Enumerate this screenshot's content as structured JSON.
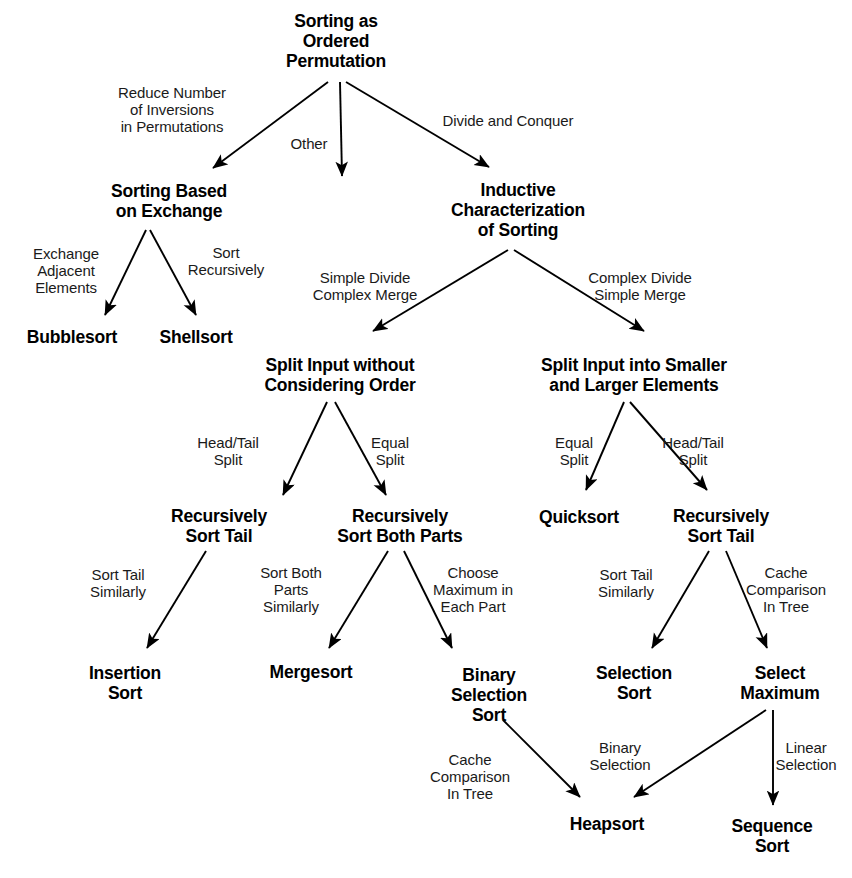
{
  "diagram": {
    "type": "tree-diagram",
    "background_color": "#ffffff",
    "text_color": "#000000",
    "arrow_color": "#000000",
    "nodes": [
      {
        "id": "root",
        "label": "Sorting as\nOrdered\nPermutation",
        "x": 336,
        "y": 42,
        "w": 200
      },
      {
        "id": "exchange",
        "label": "Sorting Based\non Exchange",
        "x": 169,
        "y": 202,
        "w": 200
      },
      {
        "id": "inductive",
        "label": "Inductive\nCharacterization\nof Sorting",
        "x": 518,
        "y": 211,
        "w": 220
      },
      {
        "id": "bubblesort",
        "label": "Bubblesort",
        "x": 72,
        "y": 338,
        "w": 140
      },
      {
        "id": "shellsort",
        "label": "Shellsort",
        "x": 196,
        "y": 338,
        "w": 130
      },
      {
        "id": "split_noorder",
        "label": "Split Input without\nConsidering Order",
        "x": 340,
        "y": 376,
        "w": 250
      },
      {
        "id": "split_smaller",
        "label": "Split Input into Smaller\nand Larger Elements",
        "x": 634,
        "y": 376,
        "w": 280
      },
      {
        "id": "rec_tail_left",
        "label": "Recursively\nSort Tail",
        "x": 219,
        "y": 527,
        "w": 160
      },
      {
        "id": "rec_both",
        "label": "Recursively\nSort Both Parts",
        "x": 400,
        "y": 527,
        "w": 190
      },
      {
        "id": "quicksort",
        "label": "Quicksort",
        "x": 579,
        "y": 518,
        "w": 130
      },
      {
        "id": "rec_tail_right",
        "label": "Recursively\nSort Tail",
        "x": 721,
        "y": 527,
        "w": 160
      },
      {
        "id": "insertion_sort",
        "label": "Insertion\nSort",
        "x": 125,
        "y": 684,
        "w": 140
      },
      {
        "id": "mergesort",
        "label": "Mergesort",
        "x": 311,
        "y": 673,
        "w": 150
      },
      {
        "id": "binary_sel_sort",
        "label": "Binary\nSelection\nSort",
        "x": 489,
        "y": 696,
        "w": 140
      },
      {
        "id": "selection_sort",
        "label": "Selection\nSort",
        "x": 634,
        "y": 684,
        "w": 140
      },
      {
        "id": "select_max",
        "label": "Select\nMaximum",
        "x": 780,
        "y": 684,
        "w": 150
      },
      {
        "id": "heapsort",
        "label": "Heapsort",
        "x": 607,
        "y": 825,
        "w": 140
      },
      {
        "id": "sequence_sort",
        "label": "Sequence\nSort",
        "x": 772,
        "y": 837,
        "w": 150
      }
    ],
    "edges": [
      {
        "from": "root",
        "to": "exchange",
        "label": "Reduce Number\nof Inversions\nin Permutations",
        "lx": 172,
        "ly": 110,
        "x1": 328,
        "y1": 82,
        "x2": 213,
        "y2": 168
      },
      {
        "from": "root",
        "to": "middle",
        "label": "Other",
        "lx": 309,
        "ly": 144,
        "x1": 340,
        "y1": 82,
        "x2": 342,
        "y2": 176
      },
      {
        "from": "root",
        "to": "inductive",
        "label": "Divide and Conquer",
        "lx": 508,
        "ly": 121,
        "x1": 346,
        "y1": 82,
        "x2": 489,
        "y2": 167
      },
      {
        "from": "exchange",
        "to": "bubblesort",
        "label": "Exchange\nAdjacent\nElements",
        "lx": 66,
        "ly": 271,
        "x1": 146,
        "y1": 230,
        "x2": 105,
        "y2": 315
      },
      {
        "from": "exchange",
        "to": "shellsort",
        "label": "Sort\nRecursively",
        "lx": 226,
        "ly": 261,
        "x1": 150,
        "y1": 230,
        "x2": 196,
        "y2": 315
      },
      {
        "from": "inductive",
        "to": "split_noorder",
        "label": "Simple Divide\nComplex Merge",
        "lx": 365,
        "ly": 286,
        "x1": 508,
        "y1": 250,
        "x2": 373,
        "y2": 331
      },
      {
        "from": "inductive",
        "to": "split_smaller",
        "label": "Complex Divide\nSimple Merge",
        "lx": 640,
        "ly": 286,
        "x1": 514,
        "y1": 250,
        "x2": 644,
        "y2": 331
      },
      {
        "from": "split_noorder",
        "to": "rec_tail_left",
        "label": "Head/Tail\nSplit",
        "lx": 228,
        "ly": 451,
        "x1": 327,
        "y1": 402,
        "x2": 283,
        "y2": 495
      },
      {
        "from": "split_noorder",
        "to": "rec_both",
        "label": "Equal\nSplit",
        "lx": 390,
        "ly": 451,
        "x1": 335,
        "y1": 402,
        "x2": 386,
        "y2": 495
      },
      {
        "from": "split_smaller",
        "to": "quicksort",
        "label": "Equal\nSplit",
        "lx": 574,
        "ly": 451,
        "x1": 624,
        "y1": 402,
        "x2": 586,
        "y2": 490
      },
      {
        "from": "split_smaller",
        "to": "rec_tail_right",
        "label": "Head/Tail\nSplit",
        "lx": 693,
        "ly": 451,
        "x1": 630,
        "y1": 402,
        "x2": 707,
        "y2": 490
      },
      {
        "from": "rec_tail_left",
        "to": "insertion_sort",
        "label": "Sort Tail\nSimilarly",
        "lx": 118,
        "ly": 583,
        "x1": 206,
        "y1": 551,
        "x2": 147,
        "y2": 648
      },
      {
        "from": "rec_both",
        "to": "mergesort",
        "label": "Sort Both\nParts\nSimilarly",
        "lx": 291,
        "ly": 590,
        "x1": 388,
        "y1": 551,
        "x2": 329,
        "y2": 648
      },
      {
        "from": "rec_both",
        "to": "binary_sel_sort",
        "label": "Choose\nMaximum in\nEach Part",
        "lx": 473,
        "ly": 590,
        "x1": 404,
        "y1": 551,
        "x2": 452,
        "y2": 648
      },
      {
        "from": "rec_tail_right",
        "to": "selection_sort",
        "label": "Sort Tail\nSimilarly",
        "lx": 626,
        "ly": 583,
        "x1": 709,
        "y1": 551,
        "x2": 652,
        "y2": 648
      },
      {
        "from": "rec_tail_right",
        "to": "select_max",
        "label": "Cache\nComparison\nIn Tree",
        "lx": 786,
        "ly": 590,
        "x1": 726,
        "y1": 551,
        "x2": 767,
        "y2": 648
      },
      {
        "from": "binary_sel_sort",
        "to": "heapsort",
        "label": "Cache\nComparison\nIn Tree",
        "lx": 470,
        "ly": 777,
        "x1": 503,
        "y1": 720,
        "x2": 580,
        "y2": 797
      },
      {
        "from": "select_max",
        "to": "heapsort",
        "label": "Binary\nSelection",
        "lx": 620,
        "ly": 756,
        "x1": 766,
        "y1": 710,
        "x2": 634,
        "y2": 797
      },
      {
        "from": "select_max",
        "to": "sequence_sort",
        "label": "Linear\nSelection",
        "lx": 806,
        "ly": 756,
        "x1": 773,
        "y1": 710,
        "x2": 773,
        "y2": 805
      }
    ]
  }
}
